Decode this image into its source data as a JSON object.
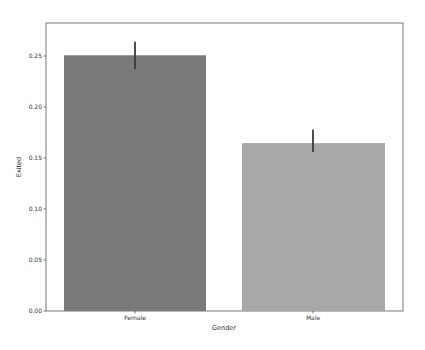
{
  "chart_data": {
    "type": "bar",
    "title": "",
    "xlabel": "Gender",
    "ylabel": "Exited",
    "categories": [
      "Female",
      "Male"
    ],
    "values": [
      0.2507,
      0.1646
    ],
    "error_bars": [
      {
        "low": 0.237,
        "high": 0.264
      },
      {
        "low": 0.156,
        "high": 0.178
      }
    ],
    "colors": [
      "#7a7a7a",
      "#a8a8a8"
    ],
    "ylim": [
      0,
      0.2686
    ],
    "yticks": [
      0.0,
      0.05,
      0.1,
      0.15,
      0.2,
      0.25
    ],
    "ytick_labels": [
      "0.00",
      "0.05",
      "0.10",
      "0.15",
      "0.20",
      "0.25"
    ],
    "grid": false,
    "legend": null
  },
  "axes": {
    "xlabel": "Gender",
    "ylabel": "Exited",
    "xtick_labels": [
      "Female",
      "Male"
    ],
    "ytick_labels": [
      "0.00",
      "0.05",
      "0.10",
      "0.15",
      "0.20",
      "0.25"
    ]
  }
}
